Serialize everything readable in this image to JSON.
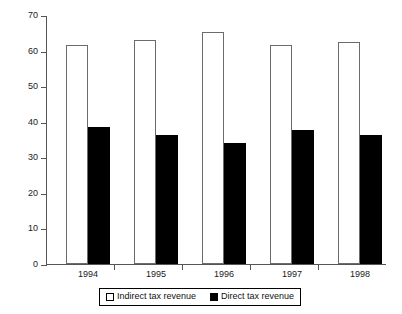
{
  "chart_data": {
    "type": "bar",
    "title": "",
    "xlabel": "",
    "ylabel": "% of total tax revenue",
    "categories": [
      "1994",
      "1995",
      "1996",
      "1997",
      "1998"
    ],
    "ylim": [
      0,
      70
    ],
    "yticks": [
      0,
      10,
      20,
      30,
      40,
      50,
      60,
      70
    ],
    "grid": false,
    "legend_position": "bottom",
    "series": [
      {
        "name": "Indirect tax revenue",
        "color": "#ffffff",
        "edge_color": "#6b6b6b",
        "swatch": "open",
        "values": [
          61.5,
          63.0,
          65.2,
          61.6,
          62.5
        ]
      },
      {
        "name": "Direct tax revenue",
        "color": "#000000",
        "edge_color": "#000000",
        "swatch": "filled",
        "values": [
          38.4,
          36.3,
          34.1,
          37.7,
          36.3
        ]
      }
    ]
  },
  "axis": {
    "y_title": "% of total tax revenue",
    "tick_labels": [
      "0",
      "10",
      "20",
      "30",
      "40",
      "50",
      "60",
      "70"
    ]
  },
  "legend": {
    "items": [
      {
        "label": "Indirect tax revenue"
      },
      {
        "label": "Direct tax revenue"
      }
    ]
  }
}
